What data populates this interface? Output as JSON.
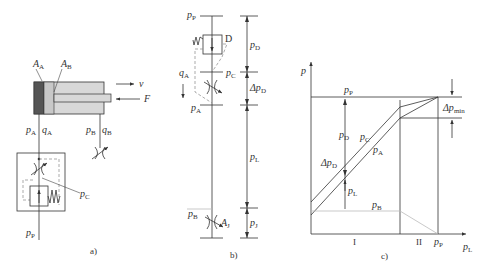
{
  "figure_a": {
    "caption": "a)",
    "labels": {
      "AA": {
        "main": "A",
        "sub": "A"
      },
      "AB": {
        "main": "A",
        "sub": "B"
      },
      "v": "v",
      "F": "F",
      "pA": {
        "main": "p",
        "sub": "A"
      },
      "qA": {
        "main": "q",
        "sub": "A"
      },
      "pB": {
        "main": "p",
        "sub": "B"
      },
      "qB": {
        "main": "q",
        "sub": "B"
      },
      "pC": {
        "main": "p",
        "sub": "C"
      },
      "pP": {
        "main": "p",
        "sub": "P"
      }
    }
  },
  "figure_b": {
    "caption": "b)",
    "labels": {
      "pP": {
        "main": "p",
        "sub": "P"
      },
      "D": "D",
      "pD": {
        "main": "p",
        "sub": "D"
      },
      "pC": {
        "main": "p",
        "sub": "C"
      },
      "qA": {
        "main": "q",
        "sub": "A"
      },
      "dpD": {
        "main": "Δp",
        "sub": "D"
      },
      "pA": {
        "main": "p",
        "sub": "A"
      },
      "pL": {
        "main": "p",
        "sub": "L"
      },
      "pB": {
        "main": "p",
        "sub": "B"
      },
      "AJ": {
        "main": "A",
        "sub": "J"
      },
      "pJ": {
        "main": "p",
        "sub": "J"
      }
    }
  },
  "figure_c": {
    "caption": "c)",
    "labels": {
      "yaxis": "p",
      "xaxis": {
        "main": "p",
        "sub": "L"
      },
      "pP": {
        "main": "p",
        "sub": "P"
      },
      "dpmin": {
        "main": "Δp",
        "sub": "min"
      },
      "pD": {
        "main": "p",
        "sub": "D"
      },
      "pC": {
        "main": "p",
        "sub": "C"
      },
      "pA": {
        "main": "p",
        "sub": "A"
      },
      "dpD": {
        "main": "Δp",
        "sub": "D"
      },
      "pL": {
        "main": "p",
        "sub": "L"
      },
      "pB": {
        "main": "p",
        "sub": "B"
      },
      "regionI": "I",
      "regionII": "II",
      "xpP": {
        "main": "p",
        "sub": "P"
      }
    }
  }
}
